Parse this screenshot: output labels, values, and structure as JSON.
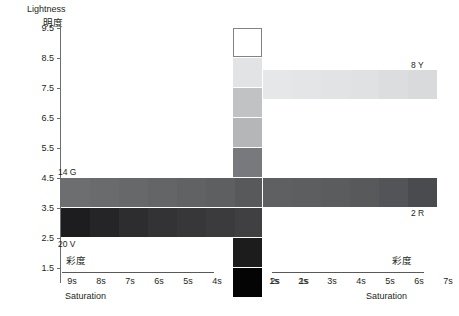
{
  "axes": {
    "y": {
      "title_en": "Lightness",
      "title_cjk": "明度",
      "ticks": [
        "9.5",
        "8.5",
        "7.5",
        "6.5",
        "5.5",
        "4.5",
        "3.5",
        "2.5",
        "1.5"
      ]
    },
    "x_left": {
      "title_en": "Saturation",
      "title_cjk": "彩度",
      "ticks": [
        "9s",
        "8s",
        "7s",
        "6s",
        "5s",
        "4s",
        "3s",
        "2s",
        "1s"
      ]
    },
    "x_right": {
      "title_en": "Saturation",
      "title_cjk": "彩度",
      "ticks": [
        "1s",
        "2s",
        "3s",
        "4s",
        "5s",
        "6s",
        "7s",
        "8s",
        "9s"
      ]
    }
  },
  "annotations": [
    {
      "id": "14g",
      "text": "14  G"
    },
    {
      "id": "20v",
      "text": "20  V"
    },
    {
      "id": "8y",
      "text": "8  Y"
    },
    {
      "id": "2r",
      "text": "2  R"
    }
  ],
  "chart_data": {
    "type": "scatter",
    "title": "",
    "xlabel": "Saturation",
    "ylabel": "Lightness",
    "grid": false,
    "legend_position": "none",
    "x_left_categories": [
      "9s",
      "8s",
      "7s",
      "6s",
      "5s",
      "4s",
      "3s",
      "2s",
      "1s"
    ],
    "x_right_categories": [
      "1s",
      "2s",
      "3s",
      "4s",
      "5s",
      "6s",
      "7s",
      "8s",
      "9s"
    ],
    "y_ticks": [
      9.5,
      8.5,
      7.5,
      6.5,
      5.5,
      4.5,
      3.5,
      2.5,
      1.5
    ],
    "ylim": [
      1.0,
      10.0
    ],
    "swatches": [
      {
        "group": "center-column",
        "side": "center",
        "saturation": "0s",
        "lightness": 9.5,
        "color": "#ffffff",
        "outlined": true,
        "x": 233,
        "y": 28
      },
      {
        "group": "center-column",
        "side": "center",
        "saturation": "0s",
        "lightness": 8.5,
        "color": "#e2e3e4",
        "outlined": false,
        "x": 233,
        "y": 58
      },
      {
        "group": "center-column",
        "side": "center",
        "saturation": "0s",
        "lightness": 7.5,
        "color": "#c0c2c4",
        "outlined": false,
        "x": 233,
        "y": 88
      },
      {
        "group": "center-column",
        "side": "center",
        "saturation": "0s",
        "lightness": 6.5,
        "color": "#b4b6b8",
        "outlined": false,
        "x": 233,
        "y": 118
      },
      {
        "group": "center-column",
        "side": "center",
        "saturation": "0s",
        "lightness": 5.5,
        "color": "#77797c",
        "outlined": false,
        "x": 233,
        "y": 148
      },
      {
        "group": "center-column",
        "side": "center",
        "saturation": "0s",
        "lightness": 4.5,
        "color": "#58595b",
        "outlined": false,
        "x": 233,
        "y": 178
      },
      {
        "group": "center-column",
        "side": "center",
        "saturation": "0s",
        "lightness": 3.5,
        "color": "#404042",
        "outlined": false,
        "x": 233,
        "y": 208
      },
      {
        "group": "center-column",
        "side": "center",
        "saturation": "0s",
        "lightness": 2.5,
        "color": "#1c1c1d",
        "outlined": false,
        "x": 233,
        "y": 238
      },
      {
        "group": "center-column",
        "side": "center",
        "saturation": "0s",
        "lightness": 1.5,
        "color": "#040404",
        "outlined": false,
        "x": 233,
        "y": 268
      },
      {
        "group": "left-row-45",
        "side": "left",
        "saturation": "9s",
        "lightness": 4.5,
        "color": "#6d6e70",
        "outlined": false,
        "x": 61,
        "y": 178
      },
      {
        "group": "left-row-45",
        "side": "left",
        "saturation": "8s",
        "lightness": 4.5,
        "color": "#6a6b6d",
        "outlined": false,
        "x": 90,
        "y": 178
      },
      {
        "group": "left-row-45",
        "side": "left",
        "saturation": "7s",
        "lightness": 4.5,
        "color": "#67686a",
        "outlined": false,
        "x": 119,
        "y": 178
      },
      {
        "group": "left-row-45",
        "side": "left",
        "saturation": "6s",
        "lightness": 4.5,
        "color": "#646567",
        "outlined": false,
        "x": 148,
        "y": 178
      },
      {
        "group": "left-row-45",
        "side": "left",
        "saturation": "5s",
        "lightness": 4.5,
        "color": "#616264",
        "outlined": false,
        "x": 177,
        "y": 178
      },
      {
        "group": "left-row-45",
        "side": "left",
        "saturation": "4s",
        "lightness": 4.5,
        "color": "#5e5f61",
        "outlined": false,
        "x": 206,
        "y": 178
      },
      {
        "group": "left-row-35",
        "side": "left",
        "saturation": "9s",
        "lightness": 3.5,
        "color": "#1d1d1f",
        "outlined": false,
        "x": 61,
        "y": 208
      },
      {
        "group": "left-row-35",
        "side": "left",
        "saturation": "8s",
        "lightness": 3.5,
        "color": "#252527",
        "outlined": false,
        "x": 90,
        "y": 208
      },
      {
        "group": "left-row-35",
        "side": "left",
        "saturation": "7s",
        "lightness": 3.5,
        "color": "#2d2d2f",
        "outlined": false,
        "x": 119,
        "y": 208
      },
      {
        "group": "left-row-35",
        "side": "left",
        "saturation": "6s",
        "lightness": 3.5,
        "color": "#333335",
        "outlined": false,
        "x": 148,
        "y": 208
      },
      {
        "group": "left-row-35",
        "side": "left",
        "saturation": "5s",
        "lightness": 3.5,
        "color": "#37373a",
        "outlined": false,
        "x": 177,
        "y": 208
      },
      {
        "group": "left-row-35",
        "side": "left",
        "saturation": "4s",
        "lightness": 3.5,
        "color": "#3b3b3e",
        "outlined": false,
        "x": 206,
        "y": 208
      },
      {
        "group": "right-row-45",
        "side": "right",
        "saturation": "1s",
        "lightness": 4.5,
        "color": "#5f6062",
        "outlined": false,
        "x": 263,
        "y": 178
      },
      {
        "group": "right-row-45",
        "side": "right",
        "saturation": "2s",
        "lightness": 4.5,
        "color": "#5d5e60",
        "outlined": false,
        "x": 292,
        "y": 178
      },
      {
        "group": "right-row-45",
        "side": "right",
        "saturation": "3s",
        "lightness": 4.5,
        "color": "#5b5c5e",
        "outlined": false,
        "x": 321,
        "y": 178
      },
      {
        "group": "right-row-45",
        "side": "right",
        "saturation": "4s",
        "lightness": 4.5,
        "color": "#58595b",
        "outlined": false,
        "x": 350,
        "y": 178
      },
      {
        "group": "right-row-45",
        "side": "right",
        "saturation": "5s",
        "lightness": 4.5,
        "color": "#535457",
        "outlined": false,
        "x": 379,
        "y": 178
      },
      {
        "group": "right-row-45",
        "side": "right",
        "saturation": "6s",
        "lightness": 4.5,
        "color": "#4a4b4e",
        "outlined": false,
        "x": 408,
        "y": 178
      },
      {
        "group": "right-row-85",
        "side": "right",
        "saturation": "1s",
        "lightness": 8.5,
        "color": "#e6e7e8",
        "outlined": false,
        "x": 263,
        "y": 70
      },
      {
        "group": "right-row-85",
        "side": "right",
        "saturation": "2s",
        "lightness": 8.5,
        "color": "#e4e5e6",
        "outlined": false,
        "x": 292,
        "y": 70
      },
      {
        "group": "right-row-85",
        "side": "right",
        "saturation": "3s",
        "lightness": 8.5,
        "color": "#e2e3e4",
        "outlined": false,
        "x": 321,
        "y": 70
      },
      {
        "group": "right-row-85",
        "side": "right",
        "saturation": "4s",
        "lightness": 8.5,
        "color": "#e0e1e2",
        "outlined": false,
        "x": 350,
        "y": 70
      },
      {
        "group": "right-row-85",
        "side": "right",
        "saturation": "5s",
        "lightness": 8.5,
        "color": "#dcdddf",
        "outlined": false,
        "x": 379,
        "y": 70
      },
      {
        "group": "right-row-85",
        "side": "right",
        "saturation": "6s",
        "lightness": 8.5,
        "color": "#d9dadc",
        "outlined": false,
        "x": 408,
        "y": 70
      }
    ]
  },
  "colors": {
    "axis": "#6d6e71",
    "rule": "#58595b",
    "text": "#231f20",
    "background": "#ffffff"
  }
}
